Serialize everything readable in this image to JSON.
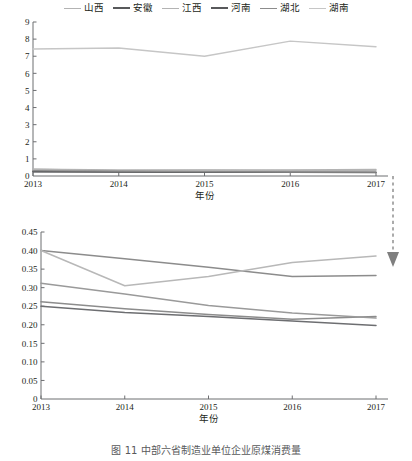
{
  "legend": {
    "items": [
      {
        "label": "山西",
        "color": "#b3b3b3",
        "width": 1.6
      },
      {
        "label": "安徽",
        "color": "#58595b",
        "width": 2.3
      },
      {
        "label": "江西",
        "color": "#b3b3b3",
        "width": 1.6
      },
      {
        "label": "河南",
        "color": "#58595b",
        "width": 2.3
      },
      {
        "label": "湖北",
        "color": "#8c8c8c",
        "width": 1.6
      },
      {
        "label": "湖南",
        "color": "#c6c6c6",
        "width": 1.6
      }
    ]
  },
  "caption": "图 11  中部六省制造业单位企业原煤消费量",
  "connector": {
    "name": "dashed-down-arrow",
    "color": "#7f7f7f"
  },
  "chart_data": [
    {
      "id": "top",
      "type": "line",
      "title": "",
      "xlabel": "年份",
      "ylabel": "",
      "x": [
        "2013",
        "2014",
        "2015",
        "2016",
        "2017"
      ],
      "ylim": [
        0,
        9
      ],
      "yticks": [
        "0",
        "1",
        "2",
        "3",
        "4",
        "5",
        "6",
        "7",
        "8",
        "9"
      ],
      "grid": false,
      "legend_position": "top",
      "series": [
        {
          "name": "山西",
          "color": "#b3b3b3",
          "width": 1.4,
          "values": [
            0.4,
            0.36,
            0.35,
            0.33,
            0.33
          ]
        },
        {
          "name": "安徽",
          "color": "#58595b",
          "width": 1.4,
          "values": [
            0.26,
            0.24,
            0.23,
            0.22,
            0.22
          ]
        },
        {
          "name": "江西",
          "color": "#b3b3b3",
          "width": 1.4,
          "values": [
            0.4,
            0.31,
            0.34,
            0.36,
            0.385
          ]
        },
        {
          "name": "河南",
          "color": "#58595b",
          "width": 1.4,
          "values": [
            0.25,
            0.235,
            0.225,
            0.21,
            0.2
          ]
        },
        {
          "name": "湖北",
          "color": "#8c8c8c",
          "width": 1.4,
          "values": [
            0.315,
            0.285,
            0.255,
            0.235,
            0.225
          ]
        },
        {
          "name": "湖南",
          "color": "#c6c6c6",
          "width": 1.4,
          "values": [
            7.42,
            7.48,
            7.0,
            7.88,
            7.55
          ]
        }
      ]
    },
    {
      "id": "bottom",
      "type": "line",
      "title": "",
      "xlabel": "年份",
      "ylabel": "",
      "x": [
        "2013",
        "2014",
        "2015",
        "2016",
        "2017"
      ],
      "ylim": [
        0,
        0.45
      ],
      "yticks": [
        "0",
        "0.05",
        "0.10",
        "0.15",
        "0.20",
        "0.25",
        "0.30",
        "0.35",
        "0.40",
        "0.45"
      ],
      "grid": false,
      "legend_position": "top",
      "series": [
        {
          "name": "山西",
          "color": "#8c8c8c",
          "width": 1.5,
          "values": [
            0.4,
            0.378,
            0.355,
            0.33,
            0.333
          ]
        },
        {
          "name": "安徽",
          "color": "#8c8c8c",
          "width": 1.5,
          "values": [
            0.262,
            0.243,
            0.228,
            0.215,
            0.222
          ]
        },
        {
          "name": "江西",
          "color": "#b8b8b8",
          "width": 1.5,
          "values": [
            0.4,
            0.305,
            0.33,
            0.368,
            0.385
          ]
        },
        {
          "name": "河南",
          "color": "#6d6e71",
          "width": 1.5,
          "values": [
            0.25,
            0.233,
            0.222,
            0.21,
            0.198
          ]
        },
        {
          "name": "湖北",
          "color": "#9a9a9a",
          "width": 1.5,
          "values": [
            0.312,
            0.283,
            0.252,
            0.232,
            0.218
          ]
        }
      ]
    }
  ]
}
